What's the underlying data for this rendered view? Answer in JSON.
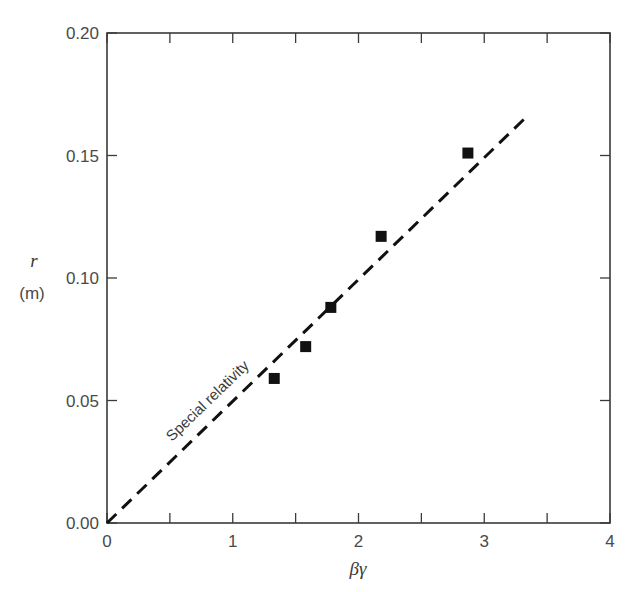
{
  "chart_data": {
    "type": "scatter",
    "title": "",
    "xlabel": "βγ",
    "ylabel": "r",
    "ylabel_unit": "(m)",
    "xlim": [
      0,
      4
    ],
    "ylim": [
      0.0,
      0.2
    ],
    "grid": false,
    "x_ticks": [
      "0",
      "1",
      "2",
      "3",
      "4"
    ],
    "x_minor_ticks": [
      0.5,
      1.5,
      2.5,
      3.5
    ],
    "y_ticks": [
      "0.00",
      "0.05",
      "0.10",
      "0.15",
      "0.20"
    ],
    "series": [
      {
        "name": "Measured",
        "marker": "square",
        "color": "#111111",
        "points": [
          {
            "x": 1.33,
            "y": 0.059
          },
          {
            "x": 1.58,
            "y": 0.072
          },
          {
            "x": 1.78,
            "y": 0.088
          },
          {
            "x": 2.18,
            "y": 0.117
          },
          {
            "x": 2.87,
            "y": 0.151
          }
        ]
      },
      {
        "name": "Special relativity",
        "type": "line",
        "style": "dashed",
        "color": "#111111",
        "points": [
          {
            "x": 0.0,
            "y": 0.0
          },
          {
            "x": 3.34,
            "y": 0.166
          }
        ]
      }
    ],
    "annotations": [
      {
        "text": "Special relativity",
        "rotation": -44,
        "near_x": 0.9,
        "near_y": 0.055
      }
    ]
  }
}
